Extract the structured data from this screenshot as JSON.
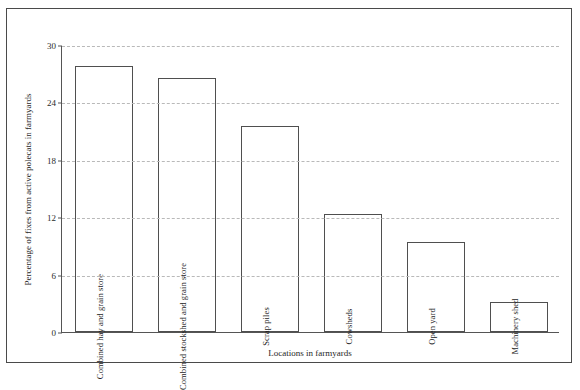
{
  "chart_data": {
    "type": "bar",
    "title": "",
    "subtitle": "",
    "xlabel": "Locations in farmyards",
    "ylabel": "Percentage of fixes from active polecats in farmyards",
    "categories": [
      "Combined hay and grain store",
      "Combined stockshed and grain store",
      "Scrap piles",
      "Cowsheds",
      "Open yard",
      "Machinery shed"
    ],
    "values": [
      27.8,
      26.5,
      21.5,
      12.3,
      9.4,
      3.1
    ],
    "ylim": [
      0,
      30
    ],
    "yticks": [
      0,
      6,
      12,
      18,
      24,
      30
    ],
    "ytick_labels": [
      "0",
      "6",
      "12",
      "18",
      "24",
      "30"
    ],
    "grid": true,
    "grid_style": "dashed-horizontal",
    "legend": null,
    "legend_position": "none",
    "bar_fill_color": "#ffffff",
    "bar_edge_color": "#4f4f4f",
    "grid_color": "#b9b9b9",
    "axis_color": "#555555",
    "frame_color": "#4a4a4a"
  },
  "axes": {
    "y_title": "Percentage of fixes from active polecats in farmyards",
    "x_title": "Locations in farmyards"
  }
}
